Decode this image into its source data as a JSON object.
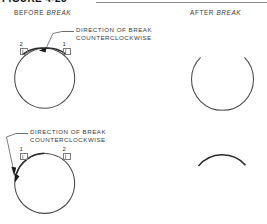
{
  "figure": {
    "title": "FIGURE 4-23",
    "header_before": {
      "plain": "BEFORE ",
      "italic": "BREAK"
    },
    "header_after": {
      "plain": "AFTER ",
      "italic": "BREAK"
    }
  },
  "notes": [
    {
      "line1": "DIRECTION OF BREAK",
      "line2": "COUNTERCLOCKWISE"
    },
    {
      "line1": "DIRECTION OF BREAK",
      "line2": "COUNTERCLOCKWISE"
    }
  ],
  "rows": [
    {
      "name": "row-1",
      "before": {
        "shape": "closed-ring",
        "terminals": [
          {
            "label": "2",
            "position": "upper-left"
          },
          {
            "label": "1",
            "position": "upper-right"
          }
        ],
        "arrow": "break-arrow-top-center"
      },
      "after": {
        "shape": "open-ring-gap-top"
      }
    },
    {
      "name": "row-2",
      "before": {
        "shape": "closed-ring",
        "terminals": [
          {
            "label": "1",
            "position": "upper-left"
          },
          {
            "label": "2",
            "position": "upper-right"
          }
        ],
        "arrow": "break-arrow-left"
      },
      "after": {
        "shape": "arc-segment-top"
      }
    }
  ],
  "colors": {
    "ring": "#4a4a4a",
    "ring_dark": "#2b2b2b",
    "leader": "#6d6d6d",
    "text": "#3a3a3a",
    "rule": "#8a8a8a"
  }
}
